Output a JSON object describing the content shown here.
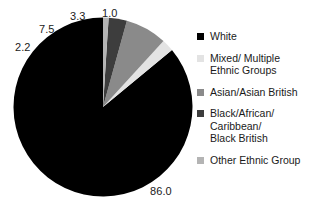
{
  "chart_data": {
    "type": "pie",
    "title": "",
    "subtitle": "",
    "xlabel": "",
    "ylabel": "",
    "grid": false,
    "legend_position": "right",
    "units": "percent",
    "start_angle_deg": 90,
    "direction": "counterclockwise",
    "categories": [
      "White",
      "Mixed/ Multiple\nEthnic Groups",
      "Asian/Asian British",
      "Black/African/\nCaribbean/\nBlack British",
      "Other Ethnic Group"
    ],
    "values": [
      86.0,
      2.2,
      7.5,
      3.3,
      1.0
    ],
    "value_labels": [
      "86.0",
      "2.2",
      "7.5",
      "3.3",
      "1.0"
    ],
    "colors": [
      "#000000",
      "#e3e3e3",
      "#8a8a8a",
      "#3d3d3d",
      "#b4b4b4"
    ],
    "slices": [
      {
        "label": "White",
        "value": 86.0,
        "display": "86.0",
        "color": "#000000"
      },
      {
        "label": "Mixed/ Multiple Ethnic Groups",
        "value": 2.2,
        "display": "2.2",
        "color": "#e3e3e3"
      },
      {
        "label": "Asian/Asian British",
        "value": 7.5,
        "display": "7.5",
        "color": "#8a8a8a"
      },
      {
        "label": "Black/African/ Caribbean/ Black British",
        "value": 3.3,
        "display": "3.3",
        "color": "#3d3d3d"
      },
      {
        "label": "Other Ethnic Group",
        "value": 1.0,
        "display": "1.0",
        "color": "#b4b4b4"
      }
    ]
  },
  "chart": {
    "labels": {
      "white": "86.0",
      "mixed": "2.2",
      "asian": "7.5",
      "black": "3.3",
      "other": "1.0"
    }
  },
  "legend": {
    "items": [
      {
        "label": "White",
        "color": "#000000"
      },
      {
        "label": "Mixed/ Multiple\nEthnic Groups",
        "color": "#e3e3e3"
      },
      {
        "label": "Asian/Asian British",
        "color": "#8a8a8a"
      },
      {
        "label": "Black/African/\nCaribbean/\nBlack British",
        "color": "#3d3d3d"
      },
      {
        "label": "Other Ethnic Group",
        "color": "#b4b4b4"
      }
    ]
  }
}
